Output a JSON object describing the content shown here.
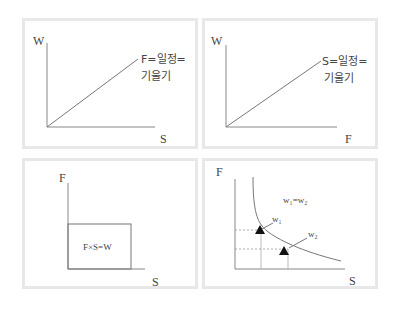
{
  "panels": [
    {
      "id": "w-vs-s",
      "y_axis_label": "W",
      "x_axis_label": "S",
      "line_label_line1": "F=일정=",
      "line_label_line2": "기울기"
    },
    {
      "id": "w-vs-f",
      "y_axis_label": "W",
      "x_axis_label": "F",
      "line_label_line1": "S=일정=",
      "line_label_line2": "기울기"
    },
    {
      "id": "f-vs-s-area",
      "y_axis_label": "F",
      "x_axis_label": "S",
      "area_label": "F×S=W"
    },
    {
      "id": "f-vs-s-hyperbola",
      "y_axis_label": "F",
      "x_axis_label": "S",
      "curve_label": "w₁=w₂",
      "point1_label": "w₁",
      "point2_label": "w₂"
    }
  ],
  "colors": {
    "panel_border": "#e8e8e8",
    "axis": "#888888",
    "marker": "#111111"
  }
}
